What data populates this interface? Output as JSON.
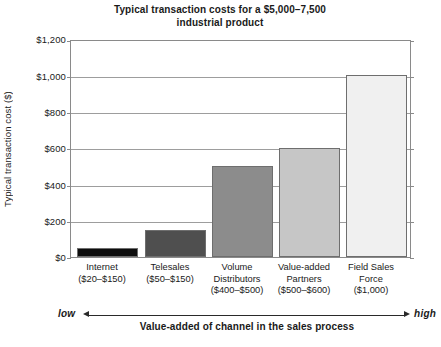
{
  "chart_data": {
    "type": "bar",
    "title": "Typical transaction costs for a $5,000–7,500 industrial product",
    "title_line1": "Typical transaction costs for a $5,000–7,500",
    "title_line2": "industrial product",
    "xlabel": "Value-added of channel in the sales process",
    "ylabel": "Typical transaction cost ($)",
    "ylim": [
      0,
      1200
    ],
    "ytick_values": [
      0,
      200,
      400,
      600,
      800,
      1000,
      1200
    ],
    "ytick_labels": [
      "$0",
      "$200",
      "$400",
      "$600",
      "$800",
      "$1,000",
      "$1,200"
    ],
    "grid": true,
    "legend": "none",
    "categories": [
      "Internet",
      "Telesales",
      "Volume Distributors",
      "Value-added Partners",
      "Field Sales Force"
    ],
    "category_ranges": [
      "($20–$150)",
      "($50–$150)",
      "($400–$500)",
      "($500–$600)",
      "($1,000)"
    ],
    "values": [
      50,
      150,
      500,
      600,
      1000
    ],
    "bar_colors": [
      "#0d0d0d",
      "#4f4f4f",
      "#8c8c8c",
      "#c6c6c6",
      "#f0f0f0"
    ],
    "bars": [
      {
        "category": "Internet",
        "label_line1": "Internet",
        "label_line2": "($20–$150)",
        "label_line3": "",
        "value": 50,
        "color": "#0d0d0d"
      },
      {
        "category": "Telesales",
        "label_line1": "Telesales",
        "label_line2": "($50–$150)",
        "label_line3": "",
        "value": 150,
        "color": "#4f4f4f"
      },
      {
        "category": "Volume Distributors",
        "label_line1": "Volume",
        "label_line2": "Distributors",
        "label_line3": "($400–$500)",
        "value": 500,
        "color": "#8c8c8c"
      },
      {
        "category": "Value-added Partners",
        "label_line1": "Value-added",
        "label_line2": "Partners",
        "label_line3": "($500–$600)",
        "value": 600,
        "color": "#c6c6c6"
      },
      {
        "category": "Field Sales Force",
        "label_line1": "Field Sales",
        "label_line2": "Force",
        "label_line3": "($1,000)",
        "value": 1000,
        "color": "#f0f0f0"
      }
    ],
    "axis_annotation": {
      "low_label": "low",
      "high_label": "high",
      "caption": "Value-added of channel in the sales process"
    }
  }
}
